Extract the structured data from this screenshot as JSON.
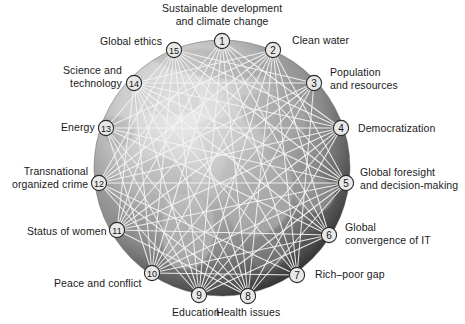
{
  "figure": {
    "type": "network-diagram",
    "background_image": "grayscale-earth-globe",
    "globe": {
      "center_x": 222,
      "center_y": 168,
      "radius": 128
    },
    "colors": {
      "node_fill": "#e8e8e8",
      "node_stroke": "#2b2b2b",
      "link": "#f2f2f2",
      "label_text": "#1a1a1a",
      "globe_light": "#bdbdbd",
      "globe_dark": "#1e1e1e",
      "page_background": "#ffffff"
    }
  },
  "chart_data": {
    "type": "network",
    "title": "",
    "nodes": [
      {
        "id": 1,
        "label": "Sustainable development\nand climate change",
        "x": 222,
        "y": 41,
        "label_x": 222,
        "label_y": 2,
        "align": "center"
      },
      {
        "id": 2,
        "label": "Clean water",
        "x": 273,
        "y": 50,
        "label_x": 292,
        "label_y": 34,
        "align": "right"
      },
      {
        "id": 3,
        "label": "Population\nand resources",
        "x": 314,
        "y": 83,
        "label_x": 330,
        "label_y": 66,
        "align": "right"
      },
      {
        "id": 4,
        "label": "Democratization",
        "x": 341,
        "y": 128,
        "label_x": 358,
        "label_y": 122,
        "align": "right"
      },
      {
        "id": 5,
        "label": "Global foresight\nand decision-making",
        "x": 346,
        "y": 183,
        "label_x": 360,
        "label_y": 166,
        "align": "right"
      },
      {
        "id": 6,
        "label": "Global\nconvergence of IT",
        "x": 329,
        "y": 235,
        "label_x": 345,
        "label_y": 221,
        "align": "right"
      },
      {
        "id": 7,
        "label": "Rich–poor gap",
        "x": 297,
        "y": 275,
        "label_x": 315,
        "label_y": 268,
        "align": "right"
      },
      {
        "id": 8,
        "label": "Health issues",
        "x": 248,
        "y": 296,
        "label_x": 248,
        "label_y": 306,
        "align": "center"
      },
      {
        "id": 9,
        "label": "Education",
        "x": 199,
        "y": 295,
        "label_x": 196,
        "label_y": 306,
        "align": "center"
      },
      {
        "id": 10,
        "label": "Peace and conflict",
        "x": 152,
        "y": 273,
        "label_x": 142,
        "label_y": 277,
        "align": "left"
      },
      {
        "id": 11,
        "label": "Status of women",
        "x": 117,
        "y": 230,
        "label_x": 107,
        "label_y": 225,
        "align": "left"
      },
      {
        "id": 12,
        "label": "Transnational\norganized crime",
        "x": 99,
        "y": 183,
        "label_x": 88,
        "label_y": 165,
        "align": "left"
      },
      {
        "id": 13,
        "label": "Energy",
        "x": 106,
        "y": 128,
        "label_x": 95,
        "label_y": 121,
        "align": "left"
      },
      {
        "id": 14,
        "label": "Science and\ntechnology",
        "x": 134,
        "y": 83,
        "label_x": 122,
        "label_y": 64,
        "align": "left"
      },
      {
        "id": 15,
        "label": "Global ethics",
        "x": 174,
        "y": 50,
        "label_x": 162,
        "label_y": 35,
        "align": "left"
      }
    ],
    "edges": [
      [
        1,
        4
      ],
      [
        1,
        5
      ],
      [
        1,
        6
      ],
      [
        1,
        7
      ],
      [
        1,
        8
      ],
      [
        1,
        9
      ],
      [
        1,
        10
      ],
      [
        1,
        11
      ],
      [
        1,
        12
      ],
      [
        2,
        5
      ],
      [
        2,
        6
      ],
      [
        2,
        7
      ],
      [
        2,
        8
      ],
      [
        2,
        9
      ],
      [
        2,
        10
      ],
      [
        2,
        11
      ],
      [
        2,
        12
      ],
      [
        2,
        13
      ],
      [
        2,
        14
      ],
      [
        3,
        7
      ],
      [
        3,
        9
      ],
      [
        3,
        10
      ],
      [
        3,
        11
      ],
      [
        3,
        12
      ],
      [
        3,
        14
      ],
      [
        3,
        15
      ],
      [
        4,
        8
      ],
      [
        4,
        9
      ],
      [
        4,
        10
      ],
      [
        4,
        11
      ],
      [
        4,
        12
      ],
      [
        4,
        13
      ],
      [
        4,
        14
      ],
      [
        4,
        15
      ],
      [
        5,
        8
      ],
      [
        5,
        9
      ],
      [
        5,
        10
      ],
      [
        5,
        11
      ],
      [
        5,
        12
      ],
      [
        5,
        13
      ],
      [
        5,
        14
      ],
      [
        5,
        15
      ],
      [
        6,
        9
      ],
      [
        6,
        10
      ],
      [
        6,
        11
      ],
      [
        6,
        13
      ],
      [
        6,
        14
      ],
      [
        6,
        15
      ],
      [
        7,
        10
      ],
      [
        7,
        12
      ],
      [
        7,
        14
      ],
      [
        7,
        15
      ],
      [
        8,
        11
      ],
      [
        8,
        12
      ],
      [
        8,
        13
      ],
      [
        8,
        14
      ],
      [
        8,
        15
      ],
      [
        9,
        12
      ],
      [
        9,
        13
      ],
      [
        9,
        14
      ],
      [
        9,
        15
      ],
      [
        10,
        13
      ],
      [
        10,
        14
      ],
      [
        10,
        15
      ],
      [
        11,
        14
      ],
      [
        11,
        15
      ],
      [
        12,
        15
      ],
      [
        13,
        15
      ]
    ]
  }
}
